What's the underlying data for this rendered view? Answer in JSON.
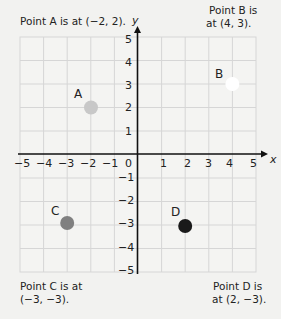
{
  "notes": {
    "a": "Point A is at (−2, 2).",
    "b_line1": "Point B is",
    "b_line2": "at (4, 3).",
    "c_line1": "Point C is at",
    "c_line2": "(−3, −3).",
    "d_line1": "Point D is",
    "d_line2": "at (2, −3)."
  },
  "axes": {
    "x_label": "x",
    "y_label": "y",
    "x_ticks": [
      "−5",
      "−4",
      "−3",
      "−2",
      "−1",
      "0",
      "1",
      "2",
      "3",
      "4",
      "5"
    ],
    "y_ticks": [
      "5",
      "4",
      "3",
      "2",
      "1",
      "−1",
      "−2",
      "−3",
      "−4",
      "−5"
    ]
  },
  "points": [
    {
      "label": "A",
      "x": -2,
      "y": 2,
      "color": "#c8c8c8"
    },
    {
      "label": "B",
      "x": 4,
      "y": 3,
      "color": "#ffffff"
    },
    {
      "label": "C",
      "x": -3,
      "y": -3,
      "color": "#808080"
    },
    {
      "label": "D",
      "x": 2,
      "y": -3,
      "color": "#1a1a1a"
    }
  ],
  "colors": {
    "background": "#f2f2f0",
    "grid": "#d6d6d6",
    "axis": "#111111"
  }
}
